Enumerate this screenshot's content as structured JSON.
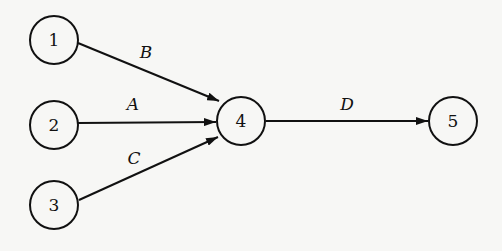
{
  "diagram": {
    "type": "directed-graph",
    "nodes": [
      {
        "id": "1",
        "label": "1",
        "x": 54,
        "y": 40
      },
      {
        "id": "2",
        "label": "2",
        "x": 54,
        "y": 125
      },
      {
        "id": "3",
        "label": "3",
        "x": 54,
        "y": 205
      },
      {
        "id": "4",
        "label": "4",
        "x": 241,
        "y": 121
      },
      {
        "id": "5",
        "label": "5",
        "x": 453,
        "y": 121
      }
    ],
    "edges": [
      {
        "from": "1",
        "to": "4",
        "label": "B"
      },
      {
        "from": "2",
        "to": "4",
        "label": "A"
      },
      {
        "from": "3",
        "to": "4",
        "label": "C"
      },
      {
        "from": "4",
        "to": "5",
        "label": "D"
      }
    ]
  }
}
